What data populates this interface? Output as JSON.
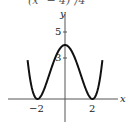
{
  "caption": "(x² − 4)²/4",
  "chart_data": {
    "type": "line",
    "title": "",
    "xlabel": "x",
    "ylabel": "y",
    "x_ticks": [
      -2,
      2
    ],
    "x_tick_labels": [
      "−2",
      "2"
    ],
    "y_ticks": [
      3,
      5
    ],
    "y_tick_labels": [
      "3",
      "5"
    ],
    "xlim": [
      -2.7,
      2.7
    ],
    "ylim": [
      -1.3,
      6.5
    ],
    "grid": false,
    "legend": null,
    "series": [
      {
        "name": "y = (x² − 4)² / 4",
        "x": [
          -2.6,
          -2.4,
          -2.2,
          -2.0,
          -1.8,
          -1.6,
          -1.4,
          -1.2,
          -1.0,
          -0.8,
          -0.6,
          -0.4,
          -0.2,
          0.0,
          0.2,
          0.4,
          0.6,
          0.8,
          1.0,
          1.2,
          1.4,
          1.6,
          1.8,
          2.0,
          2.2,
          2.4,
          2.6
        ],
        "y": [
          1.93,
          1.4,
          0.2,
          0.0,
          0.18,
          0.52,
          1.04,
          1.64,
          2.25,
          2.82,
          3.29,
          3.69,
          3.92,
          4.0,
          3.92,
          3.69,
          3.29,
          2.82,
          2.25,
          1.64,
          1.04,
          0.52,
          0.18,
          0.0,
          0.2,
          1.4,
          1.93
        ]
      }
    ],
    "key_points": [
      {
        "x": -2,
        "y": 0,
        "label": "local min"
      },
      {
        "x": 0,
        "y": 4,
        "label": "local max"
      },
      {
        "x": 2,
        "y": 0,
        "label": "local min"
      }
    ]
  }
}
